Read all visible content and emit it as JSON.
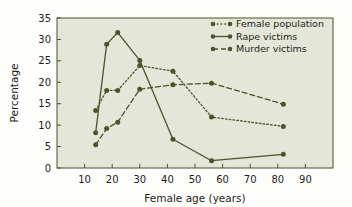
{
  "chart_data": {
    "type": "line",
    "title": "",
    "subtitle": "",
    "xlabel": "Female age (years)",
    "ylabel": "Percentage",
    "xlim": [
      0,
      100
    ],
    "ylim": [
      0,
      35
    ],
    "xticks": [
      10,
      20,
      30,
      40,
      50,
      60,
      70,
      80,
      90
    ],
    "yticks": [
      0,
      5,
      10,
      15,
      20,
      25,
      30,
      35
    ],
    "xtick_labels": [
      "10",
      "20",
      "30",
      "40",
      "50",
      "60",
      "70",
      "80",
      "90"
    ],
    "ytick_labels": [
      "0",
      "5",
      "10",
      "15",
      "20",
      "25",
      "30",
      "35"
    ],
    "grid": false,
    "legend_position": "top-right",
    "plot_background": "#e4e6d8",
    "figure_background": "#fdfdfb",
    "line_color": "#4a5428",
    "series": [
      {
        "name": "Female population",
        "style": "dotted",
        "marker": "circle",
        "x": [
          14,
          18,
          22,
          30,
          42,
          56,
          82
        ],
        "values": [
          13.4,
          18.1,
          18.1,
          23.9,
          22.6,
          11.9,
          9.7
        ]
      },
      {
        "name": "Rape victims",
        "style": "solid",
        "marker": "circle",
        "x": [
          14,
          18,
          22,
          30,
          42,
          56,
          82
        ],
        "values": [
          8.2,
          28.9,
          31.6,
          25.1,
          6.7,
          1.7,
          3.2
        ]
      },
      {
        "name": "Murder victims",
        "style": "dashed",
        "marker": "circle",
        "x": [
          14,
          18,
          22,
          30,
          42,
          56,
          82
        ],
        "values": [
          5.4,
          9.2,
          10.7,
          18.4,
          19.4,
          19.8,
          14.9
        ]
      }
    ]
  },
  "legend": {
    "items": [
      {
        "label": "Female population"
      },
      {
        "label": "Rape victims"
      },
      {
        "label": "Murder victims"
      }
    ]
  }
}
